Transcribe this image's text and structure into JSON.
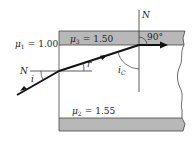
{
  "diagram": {
    "type": "optics-refraction-total-internal-reflection",
    "media": [
      {
        "id": "mu1",
        "symbol": "μ",
        "subscript": "1",
        "equals": "=",
        "value": "1.00",
        "region": "outside-left"
      },
      {
        "id": "mu3",
        "symbol": "μ",
        "subscript": "3",
        "equals": "=",
        "value": "1.50",
        "region": "top-gray-cladding"
      },
      {
        "id": "mu2",
        "symbol": "μ",
        "subscript": "2",
        "equals": "=",
        "value": "1.55",
        "region": "core"
      }
    ],
    "labels": {
      "normal_top": "N",
      "normal_left": "N",
      "angle_incidence": "i",
      "angle_refraction": "r′",
      "angle_critical": "i",
      "angle_critical_sub": "C",
      "right_angle": "90°"
    },
    "colors": {
      "cladding_fill": "#b8b8b8",
      "line": "#333333",
      "ray": "#111111",
      "background": "#ffffff"
    }
  }
}
